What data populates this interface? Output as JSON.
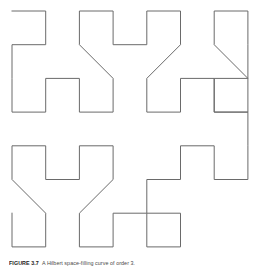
{
  "figure": {
    "caption_label": "FIGURE",
    "caption_number": "3.7",
    "caption_text": "A Hilbert space-filling curve of order 3.",
    "background_color": "#ffffff",
    "line_color": "#6a6a6a",
    "line_width": 1.0,
    "order": 3,
    "grid_cells": 8,
    "cell_size_px": 33.7,
    "origin_x_px": 12,
    "origin_y_px": 11
  },
  "chart_data": {
    "type": "line",
    "subtitle": "",
    "xlabel": "",
    "ylabel": "",
    "xlim": [
      0,
      7
    ],
    "ylim": [
      0,
      7
    ],
    "grid": false,
    "legend": "none",
    "annotations": [],
    "series": [
      {
        "name": "hilbert-order-3",
        "closed": false,
        "stroke": "#6a6a6a",
        "x": [
          0,
          1,
          1,
          0,
          0,
          0,
          1,
          1,
          2,
          2,
          3,
          3,
          2,
          2,
          3,
          3,
          4,
          4,
          5,
          5,
          4,
          4,
          5,
          5,
          6,
          6,
          7,
          7,
          6,
          6,
          7,
          7,
          7,
          6,
          6,
          7,
          7,
          7,
          6,
          6,
          5,
          5,
          4,
          4,
          5,
          5,
          4,
          4,
          3,
          3,
          2,
          2,
          3,
          3,
          2,
          2,
          1,
          1,
          0,
          0,
          1,
          1,
          0,
          0
        ],
        "y": [
          0,
          0,
          1,
          1,
          2,
          3,
          3,
          2,
          2,
          3,
          3,
          2,
          1,
          0,
          0,
          1,
          1,
          0,
          0,
          1,
          2,
          3,
          3,
          2,
          2,
          3,
          3,
          2,
          1,
          0,
          0,
          1,
          2,
          2,
          3,
          3,
          4,
          5,
          5,
          4,
          4,
          5,
          5,
          6,
          6,
          7,
          7,
          6,
          6,
          7,
          7,
          6,
          5,
          4,
          4,
          5,
          5,
          4,
          4,
          5,
          6,
          7,
          7,
          6
        ]
      }
    ]
  }
}
